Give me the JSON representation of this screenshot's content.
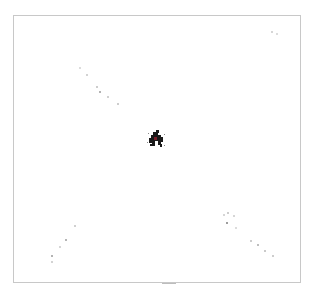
{
  "figure": {
    "frame_color": "#c8c8c8",
    "background": "#ffffff",
    "center_cluster": {
      "x": 157,
      "y": 140,
      "size": 14,
      "color": "#1a1a1a",
      "accent": "#7a1f2b"
    },
    "faint_points": [
      {
        "x": 80,
        "y": 68,
        "r": 1.2,
        "c": "#d0d0d0"
      },
      {
        "x": 87,
        "y": 75,
        "r": 1.0,
        "c": "#c4c4c4"
      },
      {
        "x": 97,
        "y": 87,
        "r": 1.0,
        "c": "#bdbdbd"
      },
      {
        "x": 100,
        "y": 92,
        "r": 1.0,
        "c": "#9a9a9a"
      },
      {
        "x": 108,
        "y": 97,
        "r": 1.0,
        "c": "#c0c0c0"
      },
      {
        "x": 118,
        "y": 104,
        "r": 1.0,
        "c": "#bcbcbc"
      },
      {
        "x": 75,
        "y": 226,
        "r": 1.0,
        "c": "#c0c0c0"
      },
      {
        "x": 66,
        "y": 240,
        "r": 1.0,
        "c": "#9c9c9c"
      },
      {
        "x": 60,
        "y": 247,
        "r": 1.0,
        "c": "#c8c8c8"
      },
      {
        "x": 52,
        "y": 256,
        "r": 1.0,
        "c": "#9a9a9a"
      },
      {
        "x": 52,
        "y": 262,
        "r": 1.0,
        "c": "#c4c4c4"
      },
      {
        "x": 224,
        "y": 215,
        "r": 1.0,
        "c": "#c8c8c8"
      },
      {
        "x": 228,
        "y": 213,
        "r": 1.0,
        "c": "#bdbdbd"
      },
      {
        "x": 227,
        "y": 223,
        "r": 1.0,
        "c": "#7d7d7d"
      },
      {
        "x": 234,
        "y": 216,
        "r": 1.0,
        "c": "#c8c8c8"
      },
      {
        "x": 236,
        "y": 228,
        "r": 1.0,
        "c": "#d0d0d0"
      },
      {
        "x": 251,
        "y": 241,
        "r": 1.2,
        "c": "#bcbcbc"
      },
      {
        "x": 258,
        "y": 245,
        "r": 1.0,
        "c": "#a8a8a8"
      },
      {
        "x": 265,
        "y": 251,
        "r": 1.0,
        "c": "#b8b8b8"
      },
      {
        "x": 273,
        "y": 256,
        "r": 1.0,
        "c": "#bcbcbc"
      },
      {
        "x": 272,
        "y": 32,
        "r": 1.0,
        "c": "#c8c8c8"
      },
      {
        "x": 277,
        "y": 34,
        "r": 1.0,
        "c": "#d0d0d0"
      }
    ],
    "bottom_tick": {
      "x": 162,
      "y": 283,
      "w": 14
    }
  }
}
